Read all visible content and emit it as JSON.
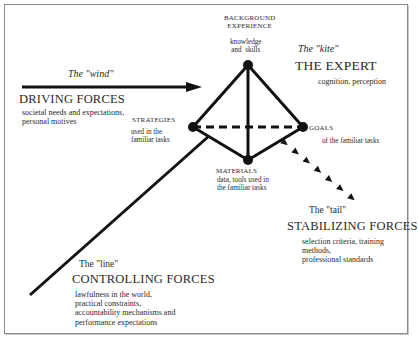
{
  "colors": {
    "ink": "#111111",
    "text": "#2a2a2a",
    "frame": "#8a8a8a",
    "background": "#ffffff"
  },
  "center": {
    "metaphor": "The \"kite\"",
    "title": "THE EXPERT",
    "description": "cognition, perception"
  },
  "nodes": {
    "background": {
      "label_line1": "BACKGROUND",
      "label_line2": "EXPERIENCE",
      "desc_line1": "knowledge",
      "desc_line2": "and  skills"
    },
    "strategies": {
      "label": "STRATEGIES",
      "desc_line1": "used in the",
      "desc_line2": "familiar tasks"
    },
    "goals": {
      "label": "GOALS",
      "desc": "of the familiar tasks"
    },
    "materials": {
      "label": "MATERIALS",
      "desc_line1": "data, tools used in",
      "desc_line2": "the familiar tasks"
    }
  },
  "forces": {
    "driving": {
      "metaphor": "The \"wind\"",
      "title": "DRIVING FORCES",
      "desc_line1": "societal needs and expectations,",
      "desc_line2": "personal motives"
    },
    "stabilizing": {
      "metaphor": "The \"tail\"",
      "title": "STABILIZING FORCES",
      "desc_line1": "selection criteria, training",
      "desc_line2": "methods,",
      "desc_line3": "professional standards"
    },
    "controlling": {
      "metaphor": "The \"line\"",
      "title": "CONTROLLING FORCES",
      "desc_line1": "lawfulness in the world,",
      "desc_line2": "practical constraints,",
      "desc_line3": "accountability mechanisms and",
      "desc_line4": "performance expectations"
    }
  }
}
